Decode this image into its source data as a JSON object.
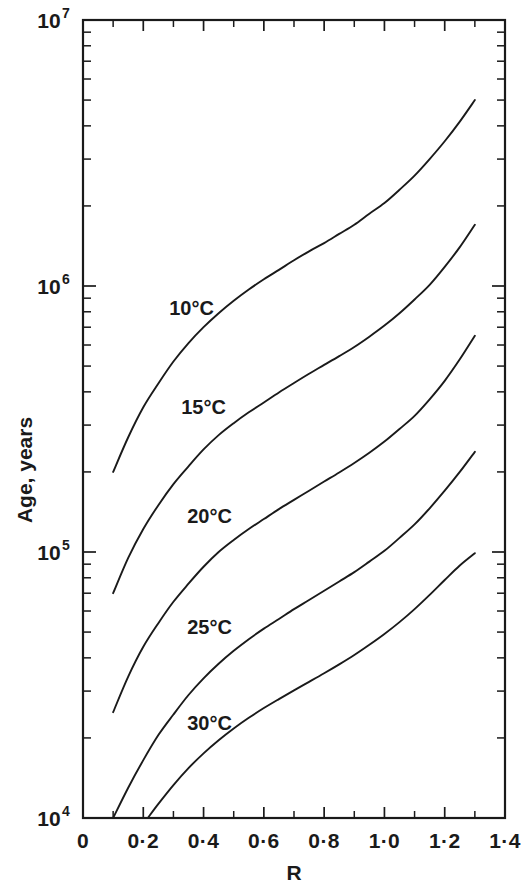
{
  "chart_data": {
    "type": "line",
    "title": "",
    "xlabel": "R",
    "ylabel": "Age, years",
    "xlim": [
      0,
      1.4
    ],
    "ylim": [
      10000,
      10000000
    ],
    "yscale": "log",
    "xscale": "linear",
    "grid": false,
    "legend": "inline-curve-labels",
    "x_ticks": [
      "0",
      "0·2",
      "0·4",
      "0·6",
      "0·8",
      "1·0",
      "1·2",
      "1·4"
    ],
    "x_tick_values": [
      0,
      0.2,
      0.4,
      0.6,
      0.8,
      1.0,
      1.2,
      1.4
    ],
    "x_minor_step": 0.1,
    "y_ticks": [
      "10⁴",
      "10⁵",
      "10⁶",
      "10⁷"
    ],
    "y_tick_bases": [
      "10",
      "10",
      "10",
      "10"
    ],
    "y_tick_exponents": [
      "4",
      "5",
      "6",
      "7"
    ],
    "y_tick_values": [
      10000,
      100000,
      1000000,
      10000000
    ],
    "series": [
      {
        "name": "10°C",
        "label": "10°C",
        "label_x": 0.36,
        "label_y": 780000,
        "x": [
          0.1,
          0.15,
          0.2,
          0.25,
          0.3,
          0.35,
          0.4,
          0.45,
          0.5,
          0.55,
          0.6,
          0.65,
          0.7,
          0.75,
          0.8,
          0.85,
          0.9,
          0.95,
          1.0,
          1.05,
          1.1,
          1.15,
          1.2,
          1.25,
          1.3
        ],
        "y": [
          200000,
          270000,
          350000,
          430000,
          520000,
          610000,
          700000,
          790000,
          880000,
          970000,
          1060000,
          1150000,
          1250000,
          1350000,
          1450000,
          1570000,
          1700000,
          1870000,
          2050000,
          2300000,
          2600000,
          3000000,
          3500000,
          4150000,
          5000000
        ]
      },
      {
        "name": "15°C",
        "label": "15°C",
        "label_x": 0.4,
        "label_y": 330000,
        "x": [
          0.1,
          0.15,
          0.2,
          0.25,
          0.3,
          0.35,
          0.4,
          0.45,
          0.5,
          0.55,
          0.6,
          0.65,
          0.7,
          0.75,
          0.8,
          0.85,
          0.9,
          0.95,
          1.0,
          1.05,
          1.1,
          1.15,
          1.2,
          1.25,
          1.3
        ],
        "y": [
          70000,
          95000,
          122000,
          150000,
          180000,
          210000,
          243000,
          275000,
          305000,
          335000,
          365000,
          398000,
          432000,
          468000,
          505000,
          545000,
          590000,
          645000,
          710000,
          790000,
          890000,
          1010000,
          1180000,
          1400000,
          1700000
        ]
      },
      {
        "name": "20°C",
        "label": "20°C",
        "label_x": 0.42,
        "label_y": 128000,
        "x": [
          0.1,
          0.15,
          0.2,
          0.25,
          0.3,
          0.35,
          0.4,
          0.45,
          0.5,
          0.55,
          0.6,
          0.65,
          0.7,
          0.75,
          0.8,
          0.85,
          0.9,
          0.95,
          1.0,
          1.05,
          1.1,
          1.15,
          1.2,
          1.25,
          1.3
        ],
        "y": [
          25000,
          34000,
          44000,
          54000,
          65000,
          76000,
          88000,
          100000,
          111000,
          122000,
          133000,
          145000,
          157000,
          170000,
          184000,
          199000,
          216000,
          236000,
          260000,
          290000,
          325000,
          375000,
          440000,
          530000,
          650000
        ]
      },
      {
        "name": "25°C",
        "label": "25°C",
        "label_x": 0.42,
        "label_y": 49000,
        "x": [
          0.1,
          0.15,
          0.2,
          0.25,
          0.3,
          0.35,
          0.4,
          0.45,
          0.5,
          0.55,
          0.6,
          0.65,
          0.7,
          0.75,
          0.8,
          0.85,
          0.9,
          0.95,
          1.0,
          1.05,
          1.1,
          1.15,
          1.2,
          1.25,
          1.3
        ],
        "y": [
          10000,
          13000,
          16500,
          20500,
          24500,
          29000,
          33500,
          38000,
          42500,
          47000,
          51500,
          56000,
          61000,
          66000,
          71500,
          77500,
          84000,
          92000,
          101000,
          113000,
          127000,
          146000,
          170000,
          200000,
          238000
        ]
      },
      {
        "name": "30°C",
        "label": "30°C",
        "label_x": 0.42,
        "label_y": 21500,
        "x": [
          0.215,
          0.25,
          0.3,
          0.35,
          0.4,
          0.45,
          0.5,
          0.55,
          0.6,
          0.65,
          0.7,
          0.75,
          0.8,
          0.85,
          0.9,
          0.95,
          1.0,
          1.05,
          1.1,
          1.15,
          1.2,
          1.25,
          1.3
        ],
        "y": [
          10000,
          11300,
          13300,
          15400,
          17500,
          19600,
          21700,
          23800,
          25900,
          28000,
          30200,
          32500,
          35000,
          37800,
          41000,
          44800,
          49200,
          54500,
          61000,
          69000,
          78500,
          89000,
          99000
        ]
      }
    ]
  }
}
